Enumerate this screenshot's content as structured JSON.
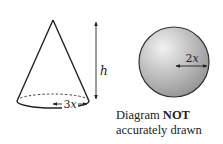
{
  "cone": {
    "height_label": "h",
    "radius_label": "3x"
  },
  "sphere": {
    "radius_label": "2x",
    "fill_color": "#b5b5b5"
  },
  "caption": {
    "line1_prefix": "Diagram ",
    "line1_bold": "NOT",
    "line2": "accurately drawn"
  }
}
